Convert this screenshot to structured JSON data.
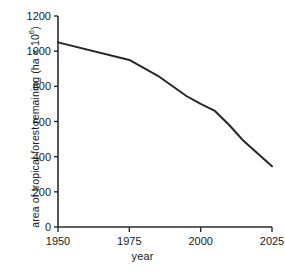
{
  "chart_data": {
    "type": "line",
    "title": "",
    "xlabel": "year",
    "ylabel": "area of tropical forest remaining (ha × 10⁶)",
    "ylabel_parts": {
      "main": "area of tropical forest remaining (ha × 10",
      "exponent": "6",
      "tail": ")"
    },
    "x": [
      1950,
      1975,
      1985,
      1995,
      2000,
      2005,
      2010,
      2015,
      2025
    ],
    "values": [
      1050,
      950,
      860,
      745,
      700,
      660,
      580,
      490,
      345
    ],
    "series": [
      {
        "name": "tropical forest area",
        "values": [
          1050,
          950,
          860,
          745,
          700,
          660,
          580,
          490,
          345
        ]
      }
    ],
    "xlim": [
      1950,
      2025
    ],
    "ylim": [
      0,
      1200
    ],
    "xticks": [
      1950,
      1975,
      2000,
      2025
    ],
    "xtick_labels": [
      "1950",
      "1975",
      "2000",
      "2025"
    ],
    "yticks": [
      0,
      200,
      400,
      600,
      800,
      1000,
      1200
    ],
    "ytick_labels": [
      "0",
      "200",
      "400",
      "600",
      "800",
      "1000",
      "1200"
    ],
    "grid": false,
    "legend": false,
    "legend_position": "none",
    "line_color": "#262626",
    "line_width": 2,
    "axis_color": "#2b2b2b",
    "background": "#ffffff",
    "annotations": []
  }
}
